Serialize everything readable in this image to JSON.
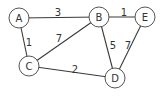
{
  "graph": {
    "nodes": [
      {
        "id": "A",
        "label": "A",
        "x": 19,
        "y": 18
      },
      {
        "id": "B",
        "label": "B",
        "x": 99,
        "y": 17
      },
      {
        "id": "E",
        "label": "E",
        "x": 145,
        "y": 17
      },
      {
        "id": "C",
        "label": "C",
        "x": 29,
        "y": 66
      },
      {
        "id": "D",
        "label": "D",
        "x": 115,
        "y": 78
      }
    ],
    "edges": [
      {
        "from": "A",
        "to": "B",
        "weight": "3",
        "lx": 58,
        "ly": 12
      },
      {
        "from": "A",
        "to": "C",
        "weight": "1",
        "lx": 29,
        "ly": 42
      },
      {
        "from": "B",
        "to": "C",
        "weight": "7",
        "lx": 59,
        "ly": 38
      },
      {
        "from": "B",
        "to": "E",
        "weight": "1",
        "lx": 124,
        "ly": 12
      },
      {
        "from": "B",
        "to": "D",
        "weight": "5",
        "lx": 113,
        "ly": 45
      },
      {
        "from": "E",
        "to": "D",
        "weight": "7",
        "lx": 128,
        "ly": 45
      },
      {
        "from": "C",
        "to": "D",
        "weight": "2",
        "lx": 75,
        "ly": 69
      }
    ],
    "node_radius": 10
  }
}
